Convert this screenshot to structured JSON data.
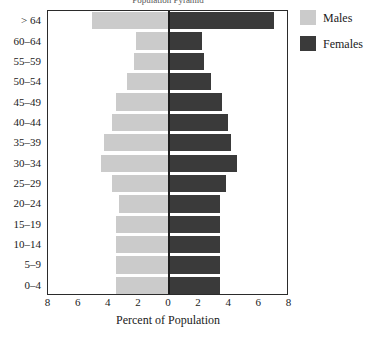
{
  "chart_data": {
    "type": "bar",
    "subtype": "population-pyramid",
    "title": "Population Pyramid",
    "xlabel": "Percent of Population",
    "ylabel": "",
    "xlim": [
      -8,
      8
    ],
    "xticks": [
      8,
      6,
      4,
      2,
      0,
      2,
      4,
      6,
      8
    ],
    "xtick_values": [
      -8,
      -6,
      -4,
      -2,
      0,
      2,
      4,
      6,
      8
    ],
    "grid": false,
    "legend_position": "right",
    "categories": [
      "> 64",
      "60–64",
      "55–59",
      "50–54",
      "45–49",
      "40–44",
      "35–39",
      "30–34",
      "25–29",
      "20–24",
      "15–19",
      "10–14",
      "5–9",
      "0–4"
    ],
    "series": [
      {
        "name": "Males",
        "side": "left",
        "color": "#cbcbcb",
        "values": [
          5.1,
          2.2,
          2.3,
          2.8,
          3.5,
          3.8,
          4.3,
          4.5,
          3.8,
          3.3,
          3.5,
          3.5,
          3.5,
          3.5
        ]
      },
      {
        "name": "Females",
        "side": "right",
        "color": "#3a3a3a",
        "values": [
          7.0,
          2.2,
          2.3,
          2.8,
          3.5,
          3.9,
          4.1,
          4.5,
          3.8,
          3.4,
          3.4,
          3.4,
          3.4,
          3.4
        ]
      }
    ]
  },
  "legend": {
    "entries": [
      {
        "label": "Males",
        "color": "#cbcbcb"
      },
      {
        "label": "Females",
        "color": "#3a3a3a"
      }
    ]
  },
  "colors": {
    "male": "#cbcbcb",
    "female": "#3a3a3a",
    "frame": "#2b2b2b",
    "background": "#ffffff",
    "text": "#1a1a1a"
  },
  "geometry": {
    "plot_left_px": 47,
    "plot_right_px": 288,
    "plot_top_px": 10,
    "plot_bottom_px": 295,
    "center_px": 168,
    "px_per_unit": 15.06
  }
}
